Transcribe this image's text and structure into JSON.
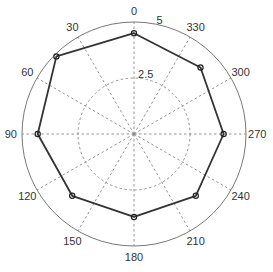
{
  "chart_data": {
    "type": "line",
    "subtype": "polar",
    "title": "",
    "angular_axis": {
      "unit": "degrees",
      "zero_location": "top",
      "direction": "counterclockwise",
      "ticks": [
        0,
        30,
        60,
        90,
        120,
        150,
        180,
        210,
        240,
        270,
        300,
        330
      ],
      "tick_labels": [
        "0",
        "30",
        "60",
        "90",
        "120",
        "150",
        "180",
        "210",
        "240",
        "270",
        "300",
        "330"
      ]
    },
    "radial_axis": {
      "range": [
        0,
        5
      ],
      "ticks": [
        2.5,
        5
      ],
      "tick_labels": [
        "2.5",
        "5"
      ]
    },
    "grid": true,
    "series": [
      {
        "name": "series-1",
        "closed": true,
        "marker": "circle",
        "theta": [
          0,
          45,
          90,
          135,
          180,
          225,
          270,
          315
        ],
        "r": [
          4.5,
          4.9,
          4.3,
          3.9,
          3.7,
          3.9,
          4.0,
          4.2
        ]
      }
    ]
  }
}
